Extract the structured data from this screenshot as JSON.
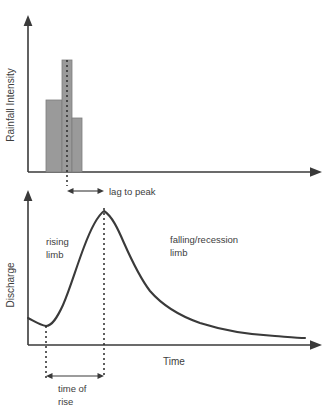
{
  "figure": {
    "type": "diagram",
    "background_color": "#ffffff",
    "ink_color": "#3a3a3a",
    "bar_fill_color": "#9a9a9a",
    "bar_stroke_color": "#7d7d7d"
  },
  "rainfall_panel": {
    "y_axis_label": "Rainfall Intensity",
    "axis": {
      "origin_x": 28,
      "baseline_y": 172,
      "y_top": 18,
      "x_end": 322
    },
    "bars": [
      {
        "label": "bar-1",
        "x": 46,
        "width": 16,
        "top_y": 100,
        "height": 72
      },
      {
        "label": "bar-2",
        "x": 62,
        "width": 10,
        "top_y": 60,
        "height": 112
      },
      {
        "label": "bar-3",
        "x": 72,
        "width": 10,
        "top_y": 118,
        "height": 54
      }
    ],
    "peak_rainfall_marker_x": 67
  },
  "discharge_panel": {
    "y_axis_label": "Discharge",
    "x_axis_label": "Time",
    "axis": {
      "origin_x": 28,
      "baseline_y": 345,
      "y_top": 193,
      "x_end": 322
    },
    "curve": {
      "start_x": 28,
      "start_y": 318,
      "trough_x": 46,
      "trough_y": 325,
      "peak_x": 104,
      "peak_y": 210,
      "end_x": 305,
      "end_y": 313
    },
    "peak_marker_x": 104,
    "rise_start_marker_x": 46
  },
  "annotations": {
    "rising_limb_line1": "rising",
    "rising_limb_line2": "limb",
    "falling_limb_line1": "falling/recession",
    "falling_limb_line2": "limb",
    "lag_to_peak": "lag to peak",
    "time_of_rise_line1": "time of",
    "time_of_rise_line2": "rise"
  }
}
